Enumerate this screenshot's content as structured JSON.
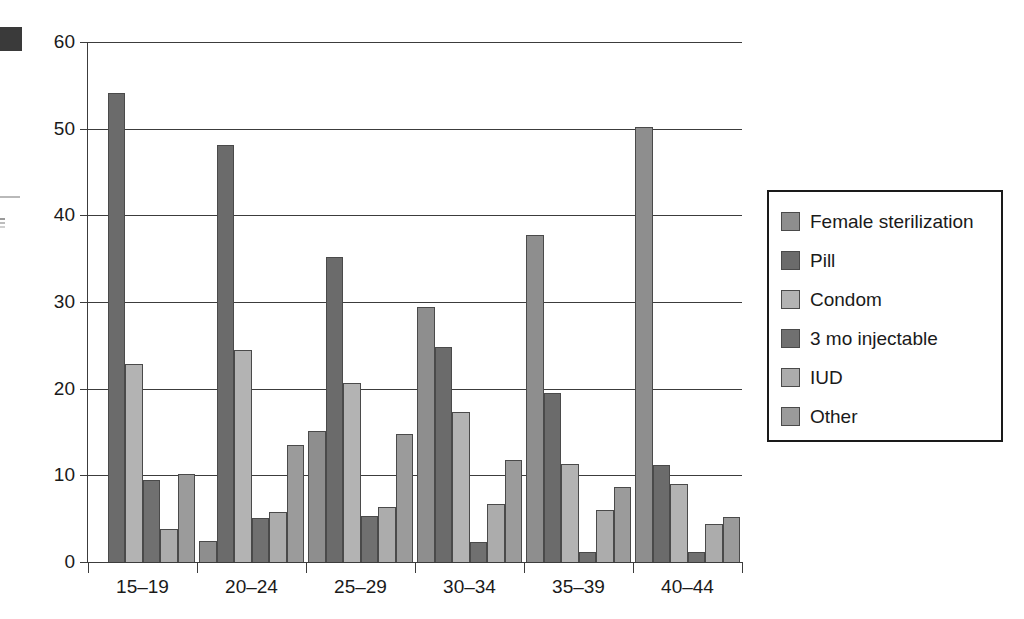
{
  "chart_data": {
    "type": "bar",
    "title": "",
    "subtitle": "",
    "xlabel": "",
    "ylabel": "",
    "ylim": [
      0,
      60
    ],
    "ytick_values": [
      0,
      10,
      20,
      30,
      40,
      50,
      60
    ],
    "ytick_labels": [
      "0",
      "10",
      "20",
      "30",
      "40",
      "50",
      "60"
    ],
    "grid": true,
    "grid_axis": "y",
    "legend_position": "right",
    "categories": [
      "15–19",
      "20–24",
      "25–29",
      "30–34",
      "35–39",
      "40–44"
    ],
    "series": [
      {
        "name": "Female sterilization",
        "color": "#8e8e8e",
        "values": [
          0,
          2.4,
          15.1,
          29.4,
          37.7,
          50.2
        ]
      },
      {
        "name": "Pill",
        "color": "#6b6b6b",
        "values": [
          54.1,
          48.1,
          35.2,
          24.8,
          19.5,
          11.2
        ]
      },
      {
        "name": "Condom",
        "color": "#b3b3b3",
        "values": [
          22.8,
          24.5,
          20.6,
          17.3,
          11.3,
          9.0
        ]
      },
      {
        "name": "3 mo injectable",
        "color": "#707070",
        "values": [
          9.5,
          5.1,
          5.3,
          2.3,
          1.1,
          1.2
        ]
      },
      {
        "name": "IUD",
        "color": "#acacac",
        "values": [
          3.8,
          5.8,
          6.3,
          6.7,
          6.0,
          4.4
        ]
      },
      {
        "name": "Other",
        "color": "#9b9b9b",
        "values": [
          10.2,
          13.5,
          14.8,
          11.8,
          8.7,
          5.2
        ]
      }
    ]
  },
  "legend": {
    "items": [
      {
        "label": "Female sterilization",
        "color": "#8e8e8e"
      },
      {
        "label": "Pill",
        "color": "#6b6b6b"
      },
      {
        "label": "Condom",
        "color": "#b3b3b3"
      },
      {
        "label": "3 mo injectable",
        "color": "#707070"
      },
      {
        "label": "IUD",
        "color": "#acacac"
      },
      {
        "label": "Other",
        "color": "#9b9b9b"
      }
    ]
  },
  "colors": {
    "background": "#ffffff",
    "axis": "#3c3c3c",
    "grid": "#3c3c3c",
    "text": "#1a1a1a",
    "bar_outline": "#4a4a4a"
  }
}
